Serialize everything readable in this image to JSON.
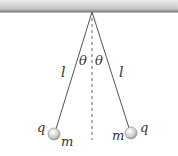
{
  "diagram": {
    "ceiling": {
      "label": ""
    },
    "left_string": {
      "label": "l"
    },
    "right_string": {
      "label": "l"
    },
    "left_angle": {
      "label": "θ"
    },
    "right_angle": {
      "label": "θ"
    },
    "left_ball": {
      "charge_label": "q",
      "mass_label": "m"
    },
    "right_ball": {
      "charge_label": "q",
      "mass_label": "m"
    },
    "colors": {
      "line": "#555555",
      "ball": "#cccccc",
      "ceiling": "#9a9a9a"
    }
  }
}
